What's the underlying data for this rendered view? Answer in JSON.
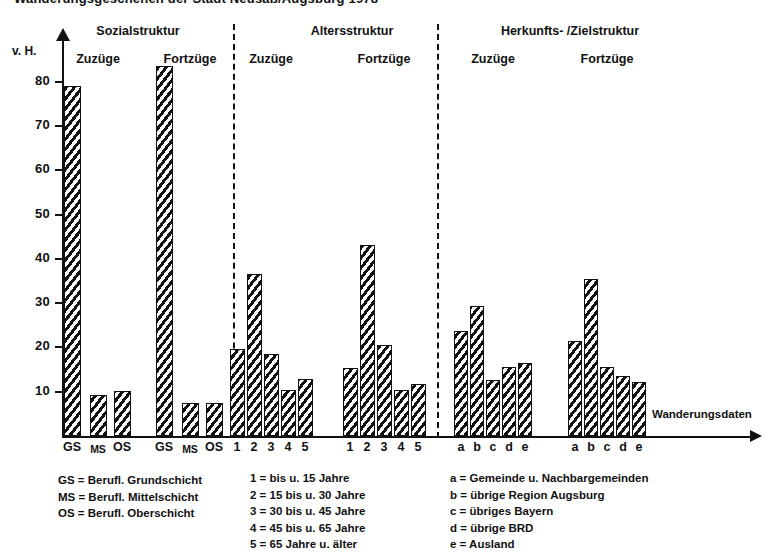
{
  "figure": {
    "number": "",
    "title": "Wanderungsgeschehen der Stadt Neusäß/Augsburg 1978"
  },
  "axes": {
    "y_unit_label": "v. H.",
    "y_ticks": [
      10,
      20,
      30,
      40,
      50,
      60,
      70,
      80
    ],
    "x_axis_title": "Wanderungsdaten"
  },
  "groups": [
    {
      "name": "Sozialstruktur",
      "sub": [
        {
          "label": "Zuzüge",
          "ticks": [
            "GS",
            "MS",
            "OS"
          ],
          "values": [
            79.0,
            9.3,
            10.2
          ]
        },
        {
          "label": "Fortzüge",
          "ticks": [
            "GS",
            "MS",
            "OS"
          ],
          "values": [
            83.5,
            7.5,
            7.5
          ]
        }
      ]
    },
    {
      "name": "Altersstruktur",
      "sub": [
        {
          "label": "Zuzüge",
          "ticks": [
            "1",
            "2",
            "3",
            "4",
            "5"
          ],
          "values": [
            19.7,
            36.5,
            18.5,
            10.5,
            12.8
          ]
        },
        {
          "label": "Fortzüge",
          "ticks": [
            "1",
            "2",
            "3",
            "4",
            "5"
          ],
          "values": [
            15.3,
            43.2,
            20.5,
            10.5,
            11.7
          ]
        }
      ]
    },
    {
      "name": "Herkunfts- /Zielstruktur",
      "sub": [
        {
          "label": "Zuzüge",
          "ticks": [
            "a",
            "b",
            "c",
            "d",
            "e"
          ],
          "values": [
            23.6,
            29.3,
            12.6,
            15.5,
            16.4
          ]
        },
        {
          "label": "Fortzüge",
          "ticks": [
            "a",
            "b",
            "c",
            "d",
            "e"
          ],
          "values": [
            21.5,
            35.5,
            15.5,
            13.6,
            12.3
          ]
        }
      ]
    }
  ],
  "legends": {
    "social": [
      "GS = Berufl. Grundschicht",
      "MS = Berufl. Mittelschicht",
      "OS = Berufl. Oberschicht"
    ],
    "age": [
      "1 =  bis u. 15 Jahre",
      "2 = 15 bis u. 30 Jahre",
      "3 = 30 bis u. 45 Jahre",
      "4 = 45 bis u. 65 Jahre",
      "5 = 65 Jahre u. älter"
    ],
    "origin": [
      "a = Gemeinde u. Nachbargemeinden",
      "b = übrige Region Augsburg",
      "c = übriges Bayern",
      "d = übrige BRD",
      "e = Ausland"
    ]
  },
  "colors": {
    "ink": "#111111",
    "paper": "#ffffff"
  },
  "chart_data": {
    "type": "bar",
    "title": "Wanderungsgeschehen der Stadt Neusäß/Augsburg 1978",
    "xlabel": "Wanderungsdaten",
    "ylabel": "v. H.",
    "ylim": [
      0,
      88
    ],
    "yticks": [
      10,
      20,
      30,
      40,
      50,
      60,
      70,
      80
    ],
    "grid": false,
    "legend_position": "below-axis",
    "panels": [
      {
        "panel": "Sozialstruktur",
        "subpanel": "Zuzüge",
        "categories": [
          "GS",
          "MS",
          "OS"
        ],
        "values": [
          79.0,
          9.3,
          10.2
        ]
      },
      {
        "panel": "Sozialstruktur",
        "subpanel": "Fortzüge",
        "categories": [
          "GS",
          "MS",
          "OS"
        ],
        "values": [
          83.5,
          7.5,
          7.5
        ]
      },
      {
        "panel": "Altersstruktur",
        "subpanel": "Zuzüge",
        "categories": [
          "1",
          "2",
          "3",
          "4",
          "5"
        ],
        "values": [
          19.7,
          36.5,
          18.5,
          10.5,
          12.8
        ]
      },
      {
        "panel": "Altersstruktur",
        "subpanel": "Fortzüge",
        "categories": [
          "1",
          "2",
          "3",
          "4",
          "5"
        ],
        "values": [
          15.3,
          43.2,
          20.5,
          10.5,
          11.7
        ]
      },
      {
        "panel": "Herkunfts- /Zielstruktur",
        "subpanel": "Zuzüge",
        "categories": [
          "a",
          "b",
          "c",
          "d",
          "e"
        ],
        "values": [
          23.6,
          29.3,
          12.6,
          15.5,
          16.4
        ]
      },
      {
        "panel": "Herkunfts- /Zielstruktur",
        "subpanel": "Fortzüge",
        "categories": [
          "a",
          "b",
          "c",
          "d",
          "e"
        ],
        "values": [
          21.5,
          35.5,
          15.5,
          13.6,
          12.3
        ]
      }
    ],
    "category_keys": {
      "GS": "Berufl. Grundschicht",
      "MS": "Berufl. Mittelschicht",
      "OS": "Berufl. Oberschicht",
      "1": "bis u. 15 Jahre",
      "2": "15 bis u. 30 Jahre",
      "3": "30 bis u. 45 Jahre",
      "4": "45 bis u. 65 Jahre",
      "5": "65 Jahre u. älter",
      "a": "Gemeinde u. Nachbargemeinden",
      "b": "übrige Region Augsburg",
      "c": "übriges Bayern",
      "d": "übrige BRD",
      "e": "Ausland"
    }
  }
}
